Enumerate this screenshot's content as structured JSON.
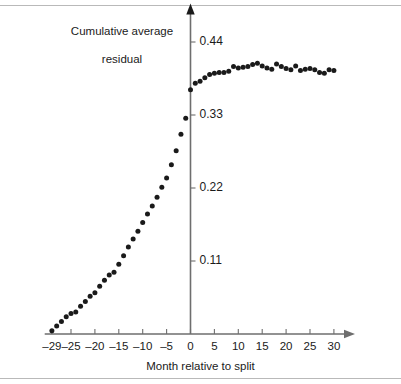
{
  "figure": {
    "background_color": "#ffffff",
    "rule_color": "#b9b9b9",
    "axis_color": "#6e6e6e",
    "marker_color": "#1a1a1a"
  },
  "chart_data": {
    "type": "scatter",
    "title": "",
    "xlabel": "Month relative to split",
    "ylabel": "Cumulative average\nresidual",
    "ylabel_line1": "Cumulative average",
    "ylabel_line2": "residual",
    "xlim": [
      -30.5,
      34
    ],
    "ylim": [
      0,
      0.48
    ],
    "grid": false,
    "legend": null,
    "xticks": [
      -29,
      -25,
      -20,
      -15,
      -10,
      -5,
      0,
      5,
      10,
      15,
      20,
      25,
      30
    ],
    "xticklabels": [
      "–29",
      "–25",
      "–20",
      "–15",
      "–10",
      "–5",
      "0",
      "5",
      "10",
      "15",
      "20",
      "25",
      "30"
    ],
    "yticks": [
      0.11,
      0.22,
      0.33,
      0.44
    ],
    "yticklabels": [
      "0.11",
      "0.22",
      "0.33",
      "0.44"
    ],
    "x": [
      -29,
      -28,
      -27,
      -26,
      -25,
      -24,
      -23,
      -22,
      -21,
      -20,
      -19,
      -18,
      -17,
      -16,
      -15,
      -14,
      -13,
      -12,
      -11,
      -10,
      -9,
      -8,
      -7,
      -6,
      -5,
      -4,
      -3,
      -2,
      -1,
      0,
      1,
      2,
      3,
      4,
      5,
      6,
      7,
      8,
      9,
      10,
      11,
      12,
      13,
      14,
      15,
      16,
      17,
      18,
      19,
      20,
      21,
      22,
      23,
      24,
      25,
      26,
      27,
      28,
      29,
      30
    ],
    "y": [
      0.005,
      0.012,
      0.019,
      0.026,
      0.031,
      0.033,
      0.042,
      0.049,
      0.057,
      0.062,
      0.072,
      0.081,
      0.089,
      0.093,
      0.105,
      0.118,
      0.131,
      0.143,
      0.155,
      0.168,
      0.181,
      0.193,
      0.206,
      0.221,
      0.235,
      0.255,
      0.276,
      0.301,
      0.325,
      0.368,
      0.378,
      0.381,
      0.386,
      0.391,
      0.393,
      0.394,
      0.394,
      0.396,
      0.403,
      0.401,
      0.402,
      0.403,
      0.406,
      0.408,
      0.404,
      0.401,
      0.399,
      0.407,
      0.403,
      0.4,
      0.398,
      0.404,
      0.397,
      0.399,
      0.4,
      0.398,
      0.394,
      0.393,
      0.398,
      0.397
    ],
    "marker": "filled-circle",
    "marker_size_px": 5
  }
}
